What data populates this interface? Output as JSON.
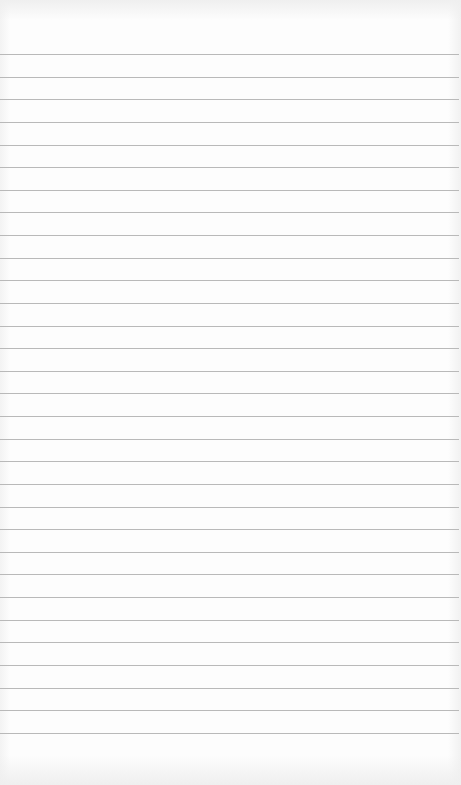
{
  "paper": {
    "type": "lined-paper",
    "line_count": 31,
    "first_line_y": 54,
    "line_spacing": 22.63,
    "line_color": "#b9b9b9",
    "background_color": "#fdfdfd"
  }
}
